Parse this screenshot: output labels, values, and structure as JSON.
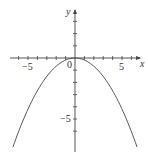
{
  "chart_data": {
    "type": "line",
    "title": "",
    "xlabel": "x",
    "ylabel": "y",
    "x_tick_labels": [
      "-5",
      "0",
      "5"
    ],
    "y_tick_labels": [
      "-5"
    ],
    "origin_label": "0",
    "xlim": [
      -7,
      7
    ],
    "ylim": [
      -7.5,
      2
    ],
    "grid": false,
    "legend": null,
    "series": [
      {
        "name": "parabola",
        "description": "downward-opening parabola with vertex at origin",
        "x": [
          -6.6,
          -5,
          -4,
          -3,
          -2,
          -1,
          0,
          1,
          2,
          3,
          4,
          5,
          6.6
        ],
        "y": [
          -7.3,
          -4.2,
          -2.7,
          -1.5,
          -0.7,
          -0.2,
          0,
          -0.2,
          -0.7,
          -1.5,
          -2.7,
          -4.2,
          -7.3
        ]
      }
    ]
  },
  "labels": {
    "x_axis": "x",
    "y_axis": "y",
    "origin": "0",
    "x_neg5": "−5",
    "x_pos5": "5",
    "y_neg5": "−5"
  }
}
